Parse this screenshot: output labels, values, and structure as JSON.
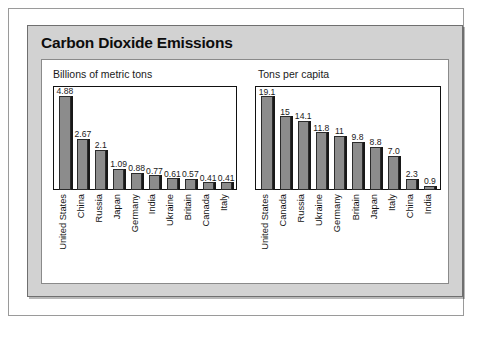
{
  "figure": {
    "title": "Carbon Dioxide Emissions"
  },
  "chart_data": [
    {
      "type": "bar",
      "title": "Billions of metric tons",
      "subtitle": "Billions of metric tons",
      "xlabel": "",
      "ylabel": "Billions of metric tons",
      "ylim": [
        0,
        5.4
      ],
      "grid": false,
      "legend": "none",
      "orientation": "vertical",
      "categories": [
        "United States",
        "China",
        "Russia",
        "Japan",
        "Germany",
        "India",
        "Ukraine",
        "Britain",
        "Canada",
        "Italy"
      ],
      "values": [
        4.88,
        2.67,
        2.1,
        1.09,
        0.88,
        0.77,
        0.61,
        0.57,
        0.41,
        0.41
      ],
      "value_labels": [
        "4.88",
        "2.67",
        "2.1",
        "1.09",
        "0.88",
        "0.77",
        "0.61",
        "0.57",
        "0.41",
        "0.41"
      ],
      "bar_color": "#8c8c8c",
      "bar_edge_color": "#2b2b2b"
    },
    {
      "type": "bar",
      "title": "Tons per capita",
      "subtitle": "Tons per capita",
      "xlabel": "",
      "ylabel": "Tons per capita",
      "ylim": [
        0,
        21.2
      ],
      "grid": false,
      "legend": "none",
      "orientation": "vertical",
      "categories": [
        "United States",
        "Canada",
        "Russia",
        "Ukraine",
        "Germany",
        "Britain",
        "Japan",
        "Italy",
        "China",
        "India"
      ],
      "values": [
        19.1,
        15,
        14.1,
        11.8,
        11,
        9.8,
        8.8,
        7.0,
        2.3,
        0.9
      ],
      "value_labels": [
        "19.1",
        "15",
        "14.1",
        "11.8",
        "11",
        "9.8",
        "8.8",
        "7.0",
        "2.3",
        "0.9"
      ],
      "bar_color": "#8c8c8c",
      "bar_edge_color": "#2b2b2b"
    }
  ],
  "colors": {
    "panel_background": "#d2d2d2",
    "card_background": "#ffffff",
    "bar_fill": "#8c8c8c",
    "bar_outline": "#2b2b2b",
    "text": "#121212"
  }
}
